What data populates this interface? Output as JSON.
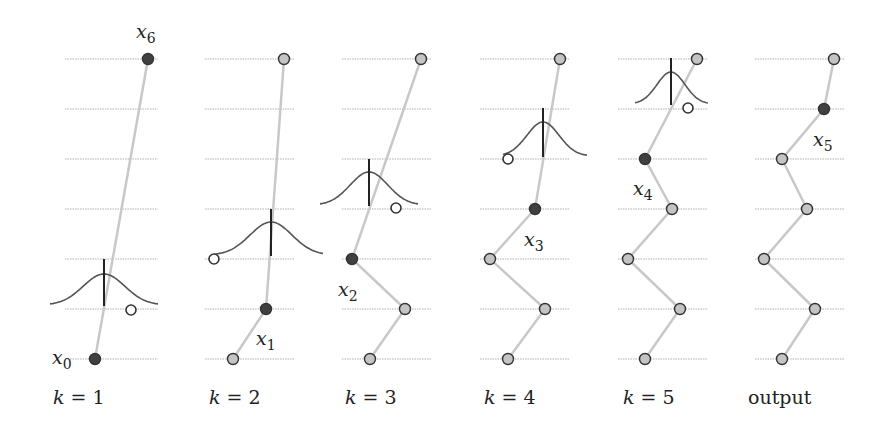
{
  "figure": {
    "colors": {
      "gridline": "#b0b0b0",
      "path": "#c8c8c8",
      "fixed_point": "#404040",
      "free_point": "#c4c4c4",
      "point_stroke": "#333333",
      "gaussian": "#555555",
      "mean_bar": "#222222",
      "proposal_circle": "#ffffff"
    },
    "levels_y": [
      59,
      109,
      159,
      209,
      259,
      309,
      359
    ],
    "panels": [
      {
        "label_prefix": "k",
        "label_eq": " = ",
        "label_value": "1",
        "label_x": 53,
        "line_x": [
          65,
          158
        ],
        "points": [
          {
            "x": 148,
            "y": 59,
            "type": "fixed"
          },
          {
            "x": 95,
            "y": 359,
            "type": "fixed"
          }
        ],
        "gaussian": {
          "cx": 104,
          "base_y": 305,
          "peak_y": 274,
          "x0": 50,
          "x1": 158,
          "bar_top": 259
        },
        "proposal": {
          "x": 131,
          "y": 310
        },
        "annotations": [
          {
            "text": "x",
            "sub": "6",
            "x": 136,
            "y": 20
          },
          {
            "text": "x",
            "sub": "0",
            "x": 52,
            "y": 346
          }
        ]
      },
      {
        "label_prefix": "k",
        "label_eq": " = ",
        "label_value": "2",
        "label_x": 209,
        "line_x": [
          205,
          295
        ],
        "points": [
          {
            "x": 284,
            "y": 59,
            "type": "free"
          },
          {
            "x": 266,
            "y": 309,
            "type": "fixed"
          },
          {
            "x": 233,
            "y": 359,
            "type": "free"
          }
        ],
        "gaussian": {
          "cx": 271,
          "base_y": 255,
          "peak_y": 222,
          "x0": 214,
          "x1": 323,
          "bar_top": 209
        },
        "proposal": {
          "x": 214,
          "y": 259
        },
        "annotations": [
          {
            "text": "x",
            "sub": "1",
            "x": 256,
            "y": 327
          }
        ]
      },
      {
        "label_prefix": "k",
        "label_eq": " = ",
        "label_value": "3",
        "label_x": 345,
        "line_x": [
          342,
          432
        ],
        "points": [
          {
            "x": 421,
            "y": 59,
            "type": "free"
          },
          {
            "x": 352,
            "y": 259,
            "type": "fixed"
          },
          {
            "x": 405,
            "y": 309,
            "type": "free"
          },
          {
            "x": 370,
            "y": 359,
            "type": "free"
          }
        ],
        "gaussian": {
          "cx": 369,
          "base_y": 205,
          "peak_y": 172,
          "x0": 320,
          "x1": 418,
          "bar_top": 159
        },
        "proposal": {
          "x": 396,
          "y": 208
        },
        "annotations": [
          {
            "text": "x",
            "sub": "2",
            "x": 338,
            "y": 278
          }
        ]
      },
      {
        "label_prefix": "k",
        "label_eq": " = ",
        "label_value": "4",
        "label_x": 484,
        "line_x": [
          480,
          570
        ],
        "points": [
          {
            "x": 560,
            "y": 59,
            "type": "free"
          },
          {
            "x": 535,
            "y": 209,
            "type": "fixed"
          },
          {
            "x": 490,
            "y": 259,
            "type": "free"
          },
          {
            "x": 545,
            "y": 309,
            "type": "free"
          },
          {
            "x": 508,
            "y": 359,
            "type": "free"
          }
        ],
        "gaussian": {
          "cx": 543,
          "base_y": 156,
          "peak_y": 122,
          "x0": 503,
          "x1": 587,
          "bar_top": 108
        },
        "proposal": {
          "x": 508,
          "y": 159
        },
        "annotations": [
          {
            "text": "x",
            "sub": "3",
            "x": 524,
            "y": 228
          }
        ]
      },
      {
        "label_prefix": "k",
        "label_eq": " = ",
        "label_value": "5",
        "label_x": 623,
        "line_x": [
          618,
          708
        ],
        "points": [
          {
            "x": 697,
            "y": 59,
            "type": "free"
          },
          {
            "x": 645,
            "y": 159,
            "type": "fixed"
          },
          {
            "x": 672,
            "y": 209,
            "type": "free"
          },
          {
            "x": 628,
            "y": 259,
            "type": "free"
          },
          {
            "x": 680,
            "y": 309,
            "type": "free"
          },
          {
            "x": 645,
            "y": 359,
            "type": "free"
          }
        ],
        "gaussian": {
          "cx": 671,
          "base_y": 104,
          "peak_y": 72,
          "x0": 635,
          "x1": 708,
          "bar_top": 58
        },
        "proposal": {
          "x": 688,
          "y": 108
        },
        "annotations": [
          {
            "text": "x",
            "sub": "4",
            "x": 633,
            "y": 177
          }
        ]
      },
      {
        "label_text": "output",
        "label_x": 748,
        "line_x": [
          755,
          845
        ],
        "points": [
          {
            "x": 834,
            "y": 59,
            "type": "free"
          },
          {
            "x": 824,
            "y": 109,
            "type": "fixed"
          },
          {
            "x": 782,
            "y": 159,
            "type": "free"
          },
          {
            "x": 807,
            "y": 209,
            "type": "free"
          },
          {
            "x": 764,
            "y": 259,
            "type": "free"
          },
          {
            "x": 815,
            "y": 309,
            "type": "free"
          },
          {
            "x": 782,
            "y": 359,
            "type": "free"
          }
        ],
        "annotations": [
          {
            "text": "x",
            "sub": "5",
            "x": 813,
            "y": 128
          }
        ]
      }
    ]
  }
}
